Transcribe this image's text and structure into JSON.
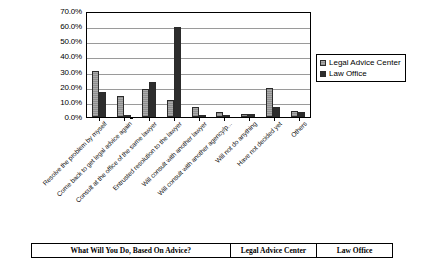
{
  "chart_data": {
    "type": "bar",
    "title": "",
    "xlabel": "",
    "ylabel": "",
    "ylim": [
      0,
      70
    ],
    "grid": true,
    "legend_position": "right",
    "ytick_labels": [
      "70.0%",
      "60.0%",
      "50.0%",
      "40.0%",
      "30.0%",
      "20.0%",
      "10.0%",
      "0.0%"
    ],
    "ytick_values": [
      70,
      60,
      50,
      40,
      30,
      20,
      10,
      0
    ],
    "categories": [
      "Resolve the problem by myself",
      "Come back to get legal advice again",
      "Consult at the office of the same lawyer",
      "Entrusted resolution to the lawyer",
      "Will consult with another lawyer",
      "Will consult with another agency/p...",
      "Will not do anything",
      "Have not decided yet",
      "Others"
    ],
    "series": [
      {
        "name": "Legal Advice Center",
        "color": "#9e9e9e",
        "values": [
          30.5,
          14.0,
          18.6,
          11.4,
          6.3,
          3.0,
          2.0,
          19.0,
          4.3
        ]
      },
      {
        "name": "Law Office",
        "color": "#2d2d2d",
        "values": [
          16.5,
          0.0,
          23.0,
          59.2,
          1.5,
          1.0,
          1.9,
          6.8,
          3.2
        ]
      }
    ]
  },
  "legend": {
    "entries": [
      {
        "label": "Legal Advice Center"
      },
      {
        "label": "Law Office"
      }
    ]
  },
  "table": {
    "headers": [
      "What Will You Do, Based On Advice?",
      "Legal Advice Center",
      "Law Office"
    ]
  }
}
